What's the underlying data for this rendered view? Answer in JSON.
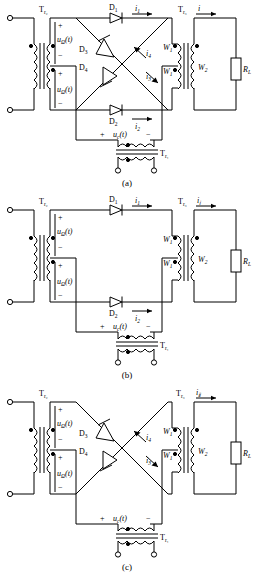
{
  "figure": {
    "type": "circuit-diagram",
    "panel_count": 3
  },
  "common": {
    "transformer_input": "T",
    "transformer_input_sub": "r2",
    "transformer_output": "T",
    "transformer_output_sub": "r3",
    "transformer_carrier": "T",
    "transformer_carrier_sub": "r1",
    "signal_label": "u",
    "signal_sub": "Ω",
    "signal_arg": "(t)",
    "carrier_label": "u",
    "carrier_sub": "c",
    "carrier_arg": "(t)",
    "winding_primary": "W",
    "winding_primary_sub": "1",
    "winding_secondary": "W",
    "winding_secondary_sub": "2",
    "load": "R",
    "load_sub": "L",
    "plus": "+",
    "minus": "−",
    "current": "i"
  },
  "panel_a": {
    "caption": "(a)",
    "top_left_transformer": "T",
    "top_left_transformer_sub": "r₂",
    "top_right_transformer": "T",
    "top_right_transformer_sub": "r₃",
    "bottom_transformer": "T",
    "bottom_transformer_sub": "r₁",
    "signal_top": "uΩ(t)",
    "signal_bottom": "uΩ(t)",
    "carrier": "uc(t)",
    "diodes": [
      {
        "name": "D",
        "sub": "1"
      },
      {
        "name": "D",
        "sub": "2"
      },
      {
        "name": "D",
        "sub": "3"
      },
      {
        "name": "D",
        "sub": "4"
      }
    ],
    "currents": [
      {
        "name": "i",
        "sub": "1"
      },
      {
        "name": "i",
        "sub": "2"
      },
      {
        "name": "i",
        "sub": "3"
      },
      {
        "name": "i",
        "sub": "4"
      },
      {
        "name": "i",
        "sub": ""
      }
    ],
    "windings": [
      "W1",
      "W1",
      "W2"
    ],
    "load": "RL",
    "polarity_top": "+",
    "polarity_mid_minus": "−",
    "polarity_mid_plus": "+",
    "polarity_bottom": "−",
    "carrier_plus": "+",
    "carrier_minus": "−"
  },
  "panel_b": {
    "caption": "(b)",
    "top_left_transformer": "T",
    "top_left_transformer_sub": "r₂",
    "top_right_transformer": "T",
    "top_right_transformer_sub": "r₃",
    "bottom_transformer": "T",
    "bottom_transformer_sub": "r₁",
    "signal_top": "uΩ(t)",
    "signal_bottom": "uΩ(t)",
    "carrier": "uc(t)",
    "diodes": [
      {
        "name": "D",
        "sub": "1"
      },
      {
        "name": "D",
        "sub": "2"
      }
    ],
    "currents": [
      {
        "name": "i",
        "sub": "1"
      },
      {
        "name": "i",
        "sub": "2"
      },
      {
        "name": "i",
        "sub": "Ⅰ"
      }
    ],
    "windings": [
      "W1",
      "W1",
      "W2"
    ],
    "load": "RL"
  },
  "panel_c": {
    "caption": "(c)",
    "top_left_transformer": "T",
    "top_left_transformer_sub": "r₂",
    "top_right_transformer": "T",
    "top_right_transformer_sub": "r₃",
    "bottom_transformer": "T",
    "bottom_transformer_sub": "r₁",
    "signal_top": "uΩ(t)",
    "signal_bottom": "uΩ(t)",
    "carrier": "uc(t)",
    "diodes": [
      {
        "name": "D",
        "sub": "3"
      },
      {
        "name": "D",
        "sub": "4"
      }
    ],
    "currents": [
      {
        "name": "i",
        "sub": "3"
      },
      {
        "name": "i",
        "sub": "4"
      },
      {
        "name": "i",
        "sub": "Ⅱ"
      }
    ],
    "windings": [
      "W1",
      "W1",
      "W2"
    ],
    "load": "RL"
  },
  "colors": {
    "line": "#000000",
    "background": "#ffffff",
    "text": "#000000"
  }
}
